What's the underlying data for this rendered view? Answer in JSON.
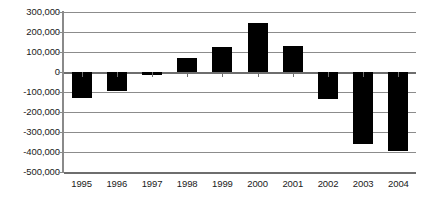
{
  "chart_data": {
    "type": "bar",
    "title": "",
    "subtitle": "",
    "xlabel": "",
    "ylabel": "",
    "categories": [
      "1995",
      "1996",
      "1997",
      "1998",
      "1999",
      "2000",
      "2001",
      "2002",
      "2003",
      "2004"
    ],
    "values": [
      -130000,
      -95000,
      -15000,
      72000,
      125000,
      245000,
      130000,
      -135000,
      -360000,
      -395000
    ],
    "series": [
      {
        "name": "",
        "values": [
          -130000,
          -95000,
          -15000,
          72000,
          125000,
          245000,
          130000,
          -135000,
          -360000,
          -395000
        ]
      }
    ],
    "ylim": [
      -500000,
      300000
    ],
    "ytick_values": [
      300000,
      200000,
      100000,
      0,
      -100000,
      -200000,
      -300000,
      -400000,
      -500000
    ],
    "ytick_labels": [
      "300,000",
      "200,000",
      "100,000",
      "0",
      "-100,000",
      "-200,000",
      "-300,000",
      "-400,000",
      "-500,000"
    ],
    "grid": true,
    "legend": false,
    "legend_position": "none",
    "bar_color": "#000000",
    "gridline_color": "#8c8c8c",
    "axis_color": "#6e6e6e",
    "background_color": "#ffffff"
  }
}
